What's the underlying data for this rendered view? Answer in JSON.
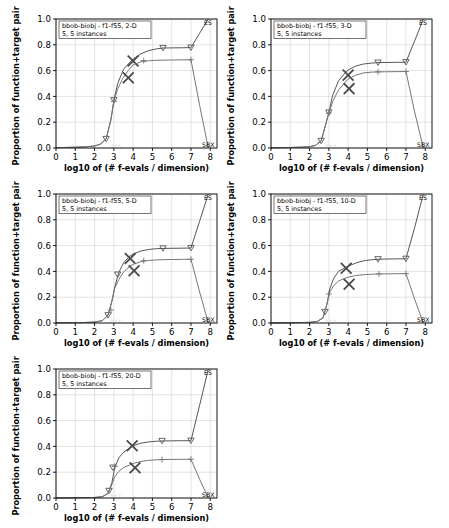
{
  "figure": {
    "xlabel": "log10 of (# f-evals / dimension)",
    "ylabel": "Proportion of function+target pairs",
    "xticks": [
      "0",
      "1",
      "2",
      "3",
      "4",
      "5",
      "6",
      "7",
      "8"
    ],
    "yticks": [
      "0.0",
      "0.2",
      "0.4",
      "0.6",
      "0.8",
      "1.0"
    ],
    "xlim": [
      0,
      8.35
    ],
    "ylim": [
      0,
      1
    ],
    "grid": true,
    "algorithm_labels": {
      "upper": "ES",
      "lower": "SBX"
    },
    "ghost_marks": "+++"
  },
  "chart_data": [
    {
      "type": "line",
      "title": "bbob-biobj - f1-f55, 2-D",
      "subtitle": "5, 5 instances",
      "dimension": "2-D",
      "xlabel": "log10 of (# f-evals / dimension)",
      "ylabel": "Proportion of function+target pairs",
      "xlim": [
        0,
        8.35
      ],
      "ylim": [
        0,
        1
      ],
      "legend_position": "right-edge",
      "series": [
        {
          "name": "ES",
          "marker": "triangle-down",
          "x": [
            0,
            0.5,
            1,
            1.5,
            2,
            2.3,
            2.6,
            2.85,
            3.0,
            3.2,
            3.5,
            3.8,
            4.0,
            4.4,
            4.8,
            5.2,
            5.55,
            6.0,
            6.5,
            7.0,
            7.45,
            7.9
          ],
          "y": [
            0.003,
            0.004,
            0.006,
            0.009,
            0.015,
            0.03,
            0.07,
            0.22,
            0.37,
            0.5,
            0.61,
            0.66,
            0.69,
            0.73,
            0.755,
            0.768,
            0.775,
            0.776,
            0.777,
            0.778,
            0.89,
            1.0
          ],
          "marker_x": [
            2.6,
            3.0,
            5.55,
            7.0
          ],
          "marker_y": [
            0.07,
            0.37,
            0.775,
            0.778
          ],
          "cross_x": [
            4.0
          ],
          "cross_y": [
            0.675
          ]
        },
        {
          "name": "SBX",
          "marker": "plus",
          "x": [
            0,
            0.5,
            1,
            1.5,
            2,
            2.3,
            2.6,
            2.85,
            3.0,
            3.2,
            3.5,
            3.8,
            4.0,
            4.4,
            4.8,
            5.2,
            5.55,
            6.0,
            6.5,
            7.0,
            7.45,
            7.9
          ],
          "y": [
            0.003,
            0.004,
            0.006,
            0.009,
            0.015,
            0.03,
            0.07,
            0.22,
            0.36,
            0.46,
            0.55,
            0.61,
            0.645,
            0.668,
            0.676,
            0.68,
            0.681,
            0.682,
            0.683,
            0.684,
            0.33,
            0.0
          ],
          "marker_x": [
            3.0,
            4.55,
            7.0
          ],
          "marker_y": [
            0.36,
            0.678,
            0.684
          ],
          "cross_x": [
            3.75
          ],
          "cross_y": [
            0.545
          ]
        }
      ]
    },
    {
      "type": "line",
      "title": "bbob-biobj - f1-f55, 3-D",
      "subtitle": "5, 5 instances",
      "dimension": "3-D",
      "xlabel": "log10 of (# f-evals / dimension)",
      "ylabel": "Proportion of function+target pairs",
      "xlim": [
        0,
        8.35
      ],
      "ylim": [
        0,
        1
      ],
      "legend_position": "right-edge",
      "series": [
        {
          "name": "ES",
          "marker": "triangle-down",
          "x": [
            0,
            0.5,
            1,
            1.5,
            2,
            2.3,
            2.6,
            2.85,
            3.0,
            3.2,
            3.5,
            3.8,
            4.0,
            4.4,
            4.8,
            5.2,
            5.55,
            6.0,
            6.5,
            7.0,
            7.45,
            7.9
          ],
          "y": [
            0.002,
            0.003,
            0.004,
            0.006,
            0.01,
            0.02,
            0.055,
            0.19,
            0.275,
            0.41,
            0.52,
            0.575,
            0.605,
            0.635,
            0.651,
            0.658,
            0.662,
            0.663,
            0.664,
            0.665,
            0.83,
            1.0
          ],
          "marker_x": [
            2.6,
            3.0,
            5.55,
            7.0
          ],
          "marker_y": [
            0.055,
            0.275,
            0.662,
            0.665
          ],
          "cross_x": [
            4.0
          ],
          "cross_y": [
            0.565
          ]
        },
        {
          "name": "SBX",
          "marker": "plus",
          "x": [
            0,
            0.5,
            1,
            1.5,
            2,
            2.3,
            2.6,
            2.85,
            3.0,
            3.2,
            3.5,
            3.8,
            4.0,
            4.4,
            4.8,
            5.2,
            5.55,
            6.0,
            6.5,
            7.0,
            7.45,
            7.9
          ],
          "y": [
            0.002,
            0.003,
            0.004,
            0.006,
            0.01,
            0.02,
            0.055,
            0.19,
            0.27,
            0.36,
            0.45,
            0.5,
            0.535,
            0.565,
            0.582,
            0.588,
            0.59,
            0.591,
            0.592,
            0.593,
            0.28,
            0.0
          ],
          "marker_x": [
            3.0,
            5.55,
            7.0
          ],
          "marker_y": [
            0.27,
            0.59,
            0.593
          ],
          "cross_x": [
            4.05
          ],
          "cross_y": [
            0.46
          ]
        }
      ]
    },
    {
      "type": "line",
      "title": "bbob-biobj - f1-f55, 5-D",
      "subtitle": "5, 5 instances",
      "dimension": "5-D",
      "xlabel": "log10 of (# f-evals / dimension)",
      "ylabel": "Proportion of function+target pairs",
      "xlim": [
        0,
        8.35
      ],
      "ylim": [
        0,
        1
      ],
      "legend_position": "right-edge",
      "series": [
        {
          "name": "ES",
          "marker": "triangle-down",
          "x": [
            0,
            0.5,
            1,
            1.5,
            2,
            2.4,
            2.7,
            2.9,
            3.05,
            3.25,
            3.5,
            3.8,
            4.0,
            4.4,
            4.8,
            5.2,
            5.55,
            6.0,
            6.5,
            7.0,
            7.45,
            7.9
          ],
          "y": [
            0.001,
            0.002,
            0.003,
            0.004,
            0.007,
            0.018,
            0.06,
            0.17,
            0.28,
            0.39,
            0.465,
            0.515,
            0.535,
            0.558,
            0.57,
            0.576,
            0.578,
            0.579,
            0.58,
            0.581,
            0.79,
            1.0
          ],
          "marker_x": [
            2.7,
            3.2,
            5.55,
            7.0
          ],
          "marker_y": [
            0.06,
            0.375,
            0.578,
            0.581
          ],
          "cross_x": [
            3.85
          ],
          "cross_y": [
            0.5
          ]
        },
        {
          "name": "SBX",
          "marker": "plus",
          "x": [
            0,
            0.5,
            1,
            1.5,
            2,
            2.4,
            2.7,
            2.9,
            3.05,
            3.25,
            3.5,
            3.8,
            4.0,
            4.4,
            4.8,
            5.2,
            5.55,
            6.0,
            6.5,
            7.0,
            7.45,
            7.9
          ],
          "y": [
            0.001,
            0.002,
            0.003,
            0.004,
            0.007,
            0.018,
            0.06,
            0.17,
            0.27,
            0.335,
            0.395,
            0.435,
            0.455,
            0.475,
            0.485,
            0.489,
            0.491,
            0.492,
            0.493,
            0.494,
            0.24,
            0.0
          ],
          "marker_x": [
            2.85,
            4.55,
            7.0
          ],
          "marker_y": [
            0.1,
            0.483,
            0.494
          ],
          "cross_x": [
            4.05
          ],
          "cross_y": [
            0.405
          ]
        }
      ]
    },
    {
      "type": "line",
      "title": "bbob-biobj - f1-f55, 10-D",
      "subtitle": "5, 5 instances",
      "dimension": "10-D",
      "xlabel": "log10 of (# f-evals / dimension)",
      "ylabel": "Proportion of function+target pairs",
      "xlim": [
        0,
        8.35
      ],
      "ylim": [
        0,
        1
      ],
      "legend_position": "right-edge",
      "series": [
        {
          "name": "ES",
          "marker": "triangle-down",
          "x": [
            0,
            0.5,
            1,
            1.5,
            2,
            2.4,
            2.7,
            2.9,
            3.05,
            3.25,
            3.5,
            3.8,
            4.0,
            4.4,
            4.8,
            5.2,
            5.55,
            6.0,
            6.5,
            7.0,
            7.45,
            7.9
          ],
          "y": [
            0.001,
            0.001,
            0.002,
            0.003,
            0.005,
            0.012,
            0.04,
            0.145,
            0.265,
            0.345,
            0.4,
            0.425,
            0.44,
            0.465,
            0.482,
            0.49,
            0.494,
            0.496,
            0.497,
            0.498,
            0.74,
            1.0
          ],
          "marker_x": [
            2.8,
            5.55,
            7.0
          ],
          "marker_y": [
            0.085,
            0.494,
            0.498
          ],
          "cross_x": [
            3.9
          ],
          "cross_y": [
            0.425
          ]
        },
        {
          "name": "SBX",
          "marker": "plus",
          "x": [
            0,
            0.5,
            1,
            1.5,
            2,
            2.4,
            2.7,
            2.9,
            3.05,
            3.25,
            3.5,
            3.8,
            4.0,
            4.4,
            4.8,
            5.2,
            5.55,
            6.0,
            6.5,
            7.0,
            7.45,
            7.9
          ],
          "y": [
            0.001,
            0.001,
            0.002,
            0.003,
            0.005,
            0.012,
            0.04,
            0.145,
            0.24,
            0.29,
            0.325,
            0.345,
            0.355,
            0.368,
            0.375,
            0.378,
            0.38,
            0.381,
            0.382,
            0.383,
            0.185,
            0.0
          ],
          "marker_x": [
            3.0,
            5.6,
            7.0
          ],
          "marker_y": [
            0.225,
            0.38,
            0.383
          ],
          "cross_x": [
            4.05
          ],
          "cross_y": [
            0.3
          ]
        }
      ]
    },
    {
      "type": "line",
      "title": "bbob-biobj - f1-f55, 20-D",
      "subtitle": "5, 5 instances",
      "dimension": "20-D",
      "xlabel": "log10 of (# f-evals / dimension)",
      "ylabel": "Proportion of function+target pairs",
      "xlim": [
        0,
        8.35
      ],
      "ylim": [
        0,
        1
      ],
      "legend_position": "right-edge",
      "series": [
        {
          "name": "ES",
          "marker": "triangle-down",
          "x": [
            0,
            0.5,
            1,
            1.5,
            2,
            2.4,
            2.7,
            2.9,
            3.05,
            3.25,
            3.5,
            3.8,
            4.0,
            4.4,
            4.8,
            5.2,
            5.55,
            6.0,
            6.5,
            7.0,
            7.45,
            7.9
          ],
          "y": [
            0.001,
            0.001,
            0.002,
            0.003,
            0.004,
            0.01,
            0.035,
            0.12,
            0.235,
            0.31,
            0.355,
            0.385,
            0.405,
            0.425,
            0.435,
            0.44,
            0.442,
            0.443,
            0.444,
            0.444,
            0.72,
            1.0
          ],
          "marker_x": [
            2.75,
            2.95,
            5.5,
            7.0
          ],
          "marker_y": [
            0.055,
            0.235,
            0.442,
            0.444
          ],
          "cross_x": [
            3.95
          ],
          "cross_y": [
            0.405
          ]
        },
        {
          "name": "SBX",
          "marker": "plus",
          "x": [
            0,
            0.5,
            1,
            1.5,
            2,
            2.4,
            2.7,
            2.9,
            3.05,
            3.25,
            3.5,
            3.8,
            4.0,
            4.4,
            4.8,
            5.2,
            5.55,
            6.0,
            6.5,
            7.0,
            7.45,
            7.9
          ],
          "y": [
            0.001,
            0.001,
            0.002,
            0.003,
            0.004,
            0.01,
            0.035,
            0.105,
            0.165,
            0.205,
            0.235,
            0.255,
            0.268,
            0.283,
            0.292,
            0.296,
            0.298,
            0.299,
            0.3,
            0.3,
            0.145,
            0.0
          ],
          "marker_x": [
            3.05,
            5.5,
            7.0
          ],
          "marker_y": [
            0.245,
            0.298,
            0.3
          ],
          "cross_x": [
            4.1
          ],
          "cross_y": [
            0.235
          ]
        }
      ]
    }
  ],
  "colors": {
    "line_upper": "#555555",
    "line_lower": "#777777",
    "grid": "#cfcfcf",
    "axis": "#000000",
    "background": "#ffffff"
  }
}
